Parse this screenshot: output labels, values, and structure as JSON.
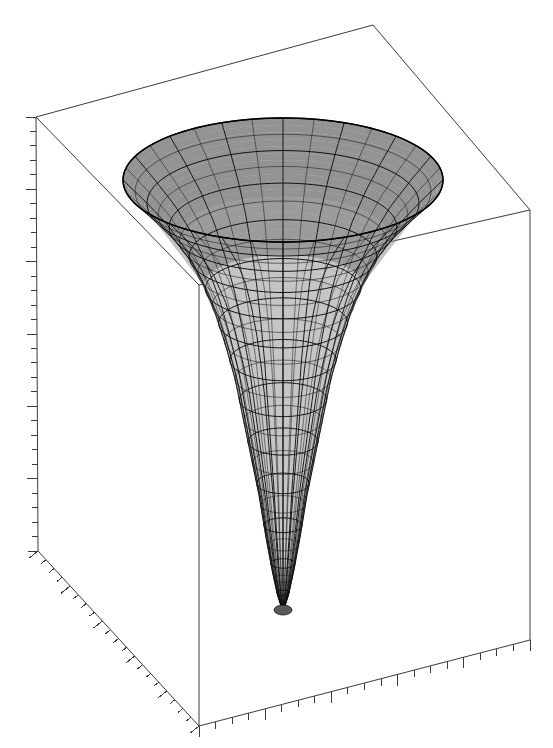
{
  "figure": {
    "kind": "3d-surface-plot",
    "title": "",
    "background_color": "#ffffff",
    "width": 553,
    "height": 748
  },
  "colors": {
    "axis_line": "#3b3b3b",
    "mesh_line": "#111111",
    "inner_surface": "#9a9a9a",
    "inner_surface_dark": "#8d8d8d",
    "outer_surface": "#c6c6c6",
    "outer_surface_light": "#d2d2d2",
    "rim_edge": "#b4b4b4",
    "background": "#ffffff"
  },
  "axes": {
    "show_numeric_labels": false,
    "x_axis": {
      "name": "x-axis",
      "label": "",
      "tick_labels": [],
      "major_tick_count": 5,
      "minor_tick_count": 20,
      "position": "bottom-right"
    },
    "y_axis": {
      "name": "y-axis",
      "label": "",
      "tick_labels": [],
      "major_tick_count": 5,
      "minor_tick_count": 20,
      "position": "bottom-left"
    },
    "z_axis": {
      "name": "z-axis",
      "label": "",
      "tick_labels": [],
      "major_tick_count": 6,
      "minor_tick_count": 30,
      "position": "left-vertical"
    }
  },
  "box": {
    "name": "bounding-box",
    "corners": {
      "top_back": [
        373,
        25
      ],
      "top_left": [
        36,
        117
      ],
      "top_right": [
        530,
        210
      ],
      "top_front": [
        199,
        285
      ],
      "bot_left": [
        38,
        551
      ],
      "bot_front": [
        199,
        726
      ],
      "bot_right": [
        530,
        640
      ]
    }
  },
  "chart_data": {
    "type": "surface",
    "title": "",
    "xlabel": "",
    "ylabel": "",
    "zlabel": "",
    "surface_kind": "funnel",
    "mesh": {
      "radial_divisions": 32,
      "ring_divisions": 26,
      "grid_on": true,
      "shaded": true
    },
    "geometry_px": {
      "center_x": 283,
      "rim_center_y": 180,
      "rim_half_width": 160,
      "rim_half_height": 62,
      "tip_x": 283,
      "tip_y": 612,
      "throat_y": 290,
      "throat_half_width": 30
    },
    "profile": {
      "comment": "radius (normalized) vs depth (normalized 0 = rim, 1 = tip)",
      "depth": [
        0.0,
        0.05,
        0.1,
        0.16,
        0.23,
        0.3,
        0.38,
        0.46,
        0.55,
        0.64,
        0.73,
        0.82,
        0.9,
        0.96,
        1.0
      ],
      "radius": [
        1.0,
        0.86,
        0.73,
        0.61,
        0.51,
        0.43,
        0.36,
        0.3,
        0.25,
        0.2,
        0.15,
        0.11,
        0.07,
        0.035,
        0.0
      ]
    },
    "axis_ranges": {
      "x": [
        -1,
        1
      ],
      "y": [
        -1,
        1
      ],
      "z": [
        -1,
        0.35
      ]
    },
    "legend": {
      "present": false,
      "entries": []
    },
    "annotations": []
  }
}
